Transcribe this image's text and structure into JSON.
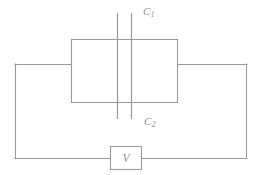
{
  "figure": {
    "width": 264,
    "height": 175,
    "background_color": "#ffffff",
    "line_color": "#9a9a9a",
    "text_color": "#8f8f8f"
  },
  "components": {
    "capacitor_top": {
      "name": "C1",
      "label_main": "C",
      "label_sub": "1",
      "type": "capacitor",
      "orientation": "vertical-plates",
      "plate_x_left": 117,
      "plate_x_right": 131,
      "plate_y_top": 13,
      "plate_y_bottom": 83
    },
    "capacitor_bottom": {
      "name": "C2",
      "label_main": "C",
      "label_sub": "2",
      "type": "capacitor",
      "orientation": "vertical-plates",
      "plate_x_left": 117,
      "plate_x_right": 131,
      "plate_y_top": 83,
      "plate_y_bottom": 119
    },
    "voltage_source": {
      "name": "V",
      "label": "V",
      "type": "voltage-source",
      "shape": "rectangle",
      "x": 110,
      "y": 146,
      "width": 32,
      "height": 24
    }
  },
  "wiring": {
    "outer_loop": {
      "left_x": 15,
      "right_x": 247,
      "top_y": 64,
      "bottom_y": 158
    },
    "inner_box": {
      "left_x": 71,
      "right_x": 178,
      "top_y": 39,
      "bottom_y": 102
    },
    "notes": "Two capacitors connected in parallel inside the inner rectangle; the rectangle is wired across a voltage source V in the outer loop."
  },
  "labels": {
    "c1": "C",
    "c1_sub": "1",
    "c2": "C",
    "c2_sub": "2",
    "v": "V"
  }
}
